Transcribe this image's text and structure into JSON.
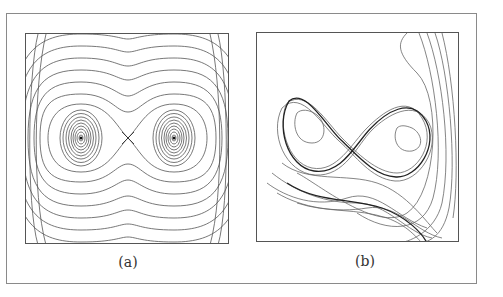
{
  "figure": {
    "panels": [
      {
        "id": "a",
        "caption": "(a)",
        "description": "Phase portrait of a double-well conservative system: nested closed orbits around two centers separated by a saddle point, surrounded by outer curves",
        "features": [
          "left center",
          "saddle point (cross)",
          "right center",
          "separatrix",
          "outer level curves"
        ]
      },
      {
        "id": "b",
        "caption": "(b)",
        "description": "Chaotic trajectories of a perturbed double-well system forming tangled figure-eight loops"
      }
    ],
    "colors": {
      "line": "#555555",
      "dark_line": "#222222",
      "frame": "#8a8a8a",
      "background": "#ffffff"
    }
  }
}
